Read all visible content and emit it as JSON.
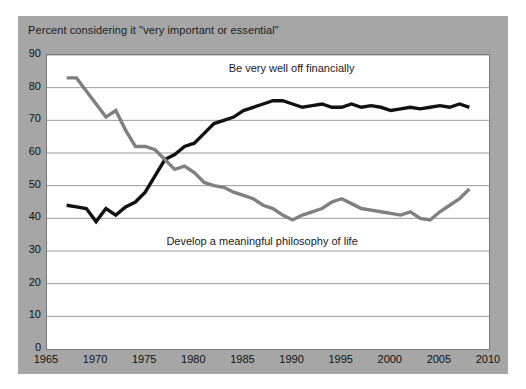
{
  "figure": {
    "caption": "Percent considering it \"very important or essential\"",
    "background_color": "#a6a6a6",
    "plot_background_color": "#ffffff"
  },
  "chart_data": {
    "type": "line",
    "title": "",
    "subtitle": "",
    "xlabel": "",
    "ylabel": "",
    "ylim": [
      0,
      90
    ],
    "xlim": [
      1965,
      2010
    ],
    "yticks": [
      0,
      10,
      20,
      30,
      40,
      50,
      60,
      70,
      80,
      90
    ],
    "xticks": [
      1965,
      1970,
      1975,
      1980,
      1985,
      1990,
      1995,
      2000,
      2005,
      2010
    ],
    "grid": "horizontal",
    "legend": "inline-annotations",
    "annotations": [
      {
        "text": "Be very well off financially",
        "x": 1990,
        "y": 85
      },
      {
        "text": "Develop a meaningful philosophy of life",
        "x": 1987,
        "y": 32
      }
    ],
    "series": [
      {
        "name": "Be very well off financially",
        "color": "#111111",
        "x": [
          1967,
          1968,
          1969,
          1970,
          1971,
          1972,
          1973,
          1974,
          1975,
          1976,
          1977,
          1978,
          1979,
          1980,
          1981,
          1982,
          1983,
          1984,
          1985,
          1986,
          1987,
          1988,
          1989,
          1990,
          1991,
          1992,
          1993,
          1994,
          1995,
          1996,
          1997,
          1998,
          1999,
          2000,
          2001,
          2002,
          2003,
          2004,
          2005,
          2006,
          2007,
          2008
        ],
        "values": [
          44,
          43.5,
          43,
          39,
          43,
          41,
          43.5,
          45,
          48,
          53,
          58,
          59.5,
          62,
          63,
          66,
          69,
          70,
          71,
          73,
          74,
          75,
          76,
          76,
          75,
          74,
          74.5,
          75,
          74,
          74,
          75,
          74,
          74.5,
          74,
          73,
          73.5,
          74,
          73.5,
          74,
          74.5,
          74,
          75,
          74
        ]
      },
      {
        "name": "Develop a meaningful philosophy of life",
        "color": "#808080",
        "x": [
          1967,
          1968,
          1969,
          1970,
          1971,
          1972,
          1973,
          1974,
          1975,
          1976,
          1977,
          1978,
          1979,
          1980,
          1981,
          1982,
          1983,
          1984,
          1985,
          1986,
          1987,
          1988,
          1989,
          1990,
          1991,
          1992,
          1993,
          1994,
          1995,
          1996,
          1997,
          1998,
          1999,
          2000,
          2001,
          2002,
          2003,
          2004,
          2005,
          2006,
          2007,
          2008
        ],
        "values": [
          83,
          83,
          79,
          75,
          71,
          73,
          67,
          62,
          62,
          61,
          58,
          55,
          56,
          54,
          51,
          50,
          49.5,
          48,
          47,
          46,
          44,
          43,
          41,
          39.5,
          41,
          42,
          43,
          45,
          46,
          44.5,
          43,
          42.5,
          42,
          41.5,
          41,
          42,
          40,
          39.5,
          42,
          44,
          46,
          49
        ]
      }
    ]
  },
  "axes": {
    "y_tick_labels": [
      "90",
      "80",
      "70",
      "60",
      "50",
      "40",
      "30",
      "20",
      "10",
      "0"
    ],
    "x_tick_labels": [
      "1965",
      "1970",
      "1975",
      "1980",
      "1985",
      "1990",
      "1995",
      "2000",
      "2005",
      "2010"
    ]
  }
}
